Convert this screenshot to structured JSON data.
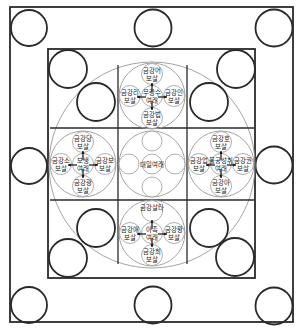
{
  "diagram": {
    "type": "mandala",
    "center": {
      "label": "대일여래"
    },
    "clusters": [
      {
        "position": "top",
        "center_line1": "무량수",
        "center_line2": "여래",
        "north": [
          "금강어",
          "보살"
        ],
        "west": [
          "금강리",
          "보살"
        ],
        "east": [
          "금강인",
          "보살"
        ],
        "south": [
          "금강법",
          "보살"
        ]
      },
      {
        "position": "left",
        "center_line1": "보생",
        "center_line2": "여래",
        "north": [
          "금강당",
          "보살"
        ],
        "west": [
          "금강소",
          "보살"
        ],
        "east": [
          "금강보",
          "보살"
        ],
        "south": [
          "금강광",
          "보살"
        ]
      },
      {
        "position": "right",
        "center_line1": "불공성취",
        "center_line2": "여래",
        "north": [
          "금강호",
          "보살"
        ],
        "west": [
          "금강업",
          "보살"
        ],
        "east": [
          "금강권",
          "보살"
        ],
        "south": [
          "금강아",
          "보살"
        ]
      },
      {
        "position": "bottom",
        "center_line1": "아촉",
        "center_line2": "여래",
        "north": [
          "금강살타",
          ""
        ],
        "west": [
          "금강애",
          "보살"
        ],
        "east": [
          "금강왕",
          "보살"
        ],
        "south": [
          "금강희",
          "보살"
        ]
      }
    ]
  }
}
